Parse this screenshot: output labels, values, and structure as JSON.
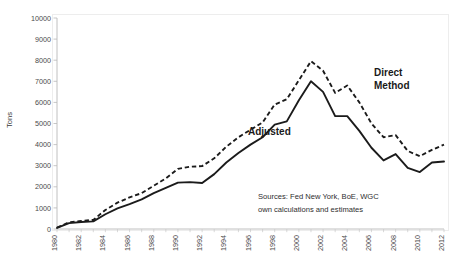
{
  "chart_data": {
    "type": "line",
    "title": "",
    "xlabel": "",
    "ylabel": "Tons",
    "xlim": [
      1980,
      2012
    ],
    "ylim": [
      0,
      10000
    ],
    "ytick_step": 1000,
    "xtick_step": 2,
    "grid": false,
    "legend_position": "inline-annotations",
    "yticks": [
      "0",
      "1000",
      "2000",
      "3000",
      "4000",
      "5000",
      "6000",
      "7000",
      "8000",
      "9000",
      "10000"
    ],
    "xticks": [
      "1980",
      "1982",
      "1984",
      "1986",
      "1988",
      "1990",
      "1992",
      "1994",
      "1996",
      "1998",
      "2000",
      "2002",
      "2004",
      "2006",
      "2008",
      "2010",
      "2012"
    ],
    "x": [
      1980,
      1981,
      1982,
      1983,
      1984,
      1985,
      1986,
      1987,
      1988,
      1989,
      1990,
      1991,
      1992,
      1993,
      1994,
      1995,
      1996,
      1997,
      1998,
      1999,
      2000,
      2001,
      2002,
      2003,
      2004,
      2005,
      2006,
      2007,
      2008,
      2009,
      2010,
      2011,
      2012
    ],
    "series": [
      {
        "name": "Direct Method",
        "style": "dashed",
        "color": "#1b1b1b",
        "values": [
          60,
          320,
          380,
          430,
          900,
          1250,
          1500,
          1700,
          2050,
          2400,
          2850,
          2950,
          2980,
          3350,
          3900,
          4350,
          4700,
          5050,
          5900,
          6150,
          7050,
          7950,
          7500,
          6450,
          6800,
          6000,
          5000,
          4350,
          4450,
          3700,
          3450,
          3750,
          4000
        ]
      },
      {
        "name": "Adjusted",
        "style": "solid",
        "color": "#1b1b1b",
        "values": [
          50,
          280,
          330,
          360,
          700,
          980,
          1180,
          1400,
          1700,
          1950,
          2200,
          2220,
          2180,
          2600,
          3150,
          3600,
          4000,
          4350,
          4950,
          5100,
          6100,
          7000,
          6500,
          5350,
          5350,
          4650,
          3850,
          3250,
          3550,
          2900,
          2700,
          3150,
          3200
        ]
      }
    ],
    "annotations": [
      {
        "name": "direct-method-label",
        "text_line1": "Direct",
        "text_line2": "Method"
      },
      {
        "name": "adjusted-label",
        "text": "Adjusted"
      },
      {
        "name": "sources-note",
        "line1": "Sources: Fed New York, BoE, WGC",
        "line2": "own calculations and estimates"
      }
    ]
  }
}
